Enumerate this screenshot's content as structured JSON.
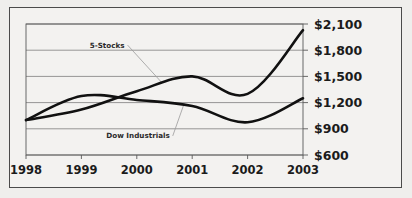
{
  "chart_data": {
    "type": "line",
    "title": "",
    "subtitle": "",
    "xlabel": "",
    "ylabel": "",
    "categories": [
      "1998",
      "1999",
      "2000",
      "2001",
      "2002",
      "2003"
    ],
    "x": [
      1998,
      1999,
      2000,
      2001,
      2002,
      2003
    ],
    "xlim": [
      1998,
      2003
    ],
    "ylim": [
      600,
      2100
    ],
    "y_tick_labels": [
      "$600",
      "$900",
      "$1,200",
      "$1,500",
      "$1,800",
      "$2,100"
    ],
    "y_tick_values": [
      600,
      900,
      1200,
      1500,
      1800,
      2100
    ],
    "y_tick_step": 300,
    "grid": true,
    "legend_position": "inline-annotation",
    "currency_prefix": "$",
    "series": [
      {
        "name": "5-Stocks",
        "color": "#111111",
        "values": [
          1000,
          1120,
          1330,
          1500,
          1300,
          2030
        ],
        "annotation": {
          "label": "5-Stocks",
          "label_x": 1999.15,
          "label_y": 1830,
          "leader_to_x": 2000.45,
          "leader_to_y": 1430
        }
      },
      {
        "name": "Dow Industrials",
        "color": "#111111",
        "values": [
          1000,
          1275,
          1230,
          1160,
          975,
          1250
        ],
        "annotation": {
          "label": "Dow Industrials",
          "label_x": 1999.45,
          "label_y": 790,
          "leader_to_x": 2000.85,
          "leader_to_y": 1180
        }
      }
    ]
  },
  "axes": {
    "x_tick_labels": [
      "1998",
      "1999",
      "2000",
      "2001",
      "2002",
      "2003"
    ],
    "y_tick_labels": [
      "$2,100",
      "$1,800",
      "$1,500",
      "$1,200",
      "$900",
      "$600"
    ]
  }
}
